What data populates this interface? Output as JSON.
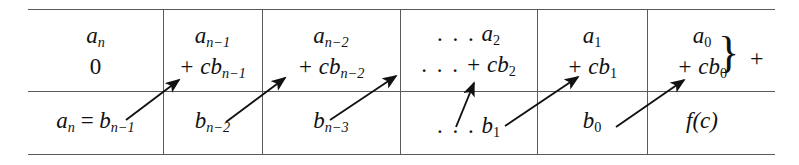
{
  "figure": {
    "type": "synthetic-division-table",
    "title": "",
    "columns": 6,
    "rows": 2,
    "accent_color": "#111111",
    "rule_color": "#5a5a5a",
    "background": "#ffffff",
    "cells": [
      {
        "id": "col1",
        "top_line1": "a",
        "top_sub1": "n",
        "top_line2": "0",
        "top_sub2": "",
        "bottom": "a",
        "bottom_sub": "n",
        "bottom_eq": " = ",
        "bottom_b": "b",
        "bottom_b_sub": "n−1"
      },
      {
        "id": "col2",
        "top_line1": "a",
        "top_sub1": "n−1",
        "top_line2": "+ cb",
        "top_sub2": "n−1",
        "bottom": "b",
        "bottom_sub": "n−2",
        "bottom_eq": "",
        "bottom_b": "",
        "bottom_b_sub": ""
      },
      {
        "id": "col3",
        "top_line1": "a",
        "top_sub1": "n−2",
        "top_line2": "+ cb",
        "top_sub2": "n−2",
        "bottom": "b",
        "bottom_sub": "n−3",
        "bottom_eq": "",
        "bottom_b": "",
        "bottom_b_sub": ""
      },
      {
        "id": "col4",
        "top_line1": "a",
        "top_sub1": "2",
        "top_line2": "+ cb",
        "top_sub2": "2",
        "bottom": "b",
        "bottom_sub": "1",
        "bottom_eq": "",
        "bottom_b": "",
        "bottom_b_sub": "",
        "leading_dots_line1": ". . .",
        "leading_dots_line2": ". . .",
        "leading_dots_bottom": ". . ."
      },
      {
        "id": "col5",
        "top_line1": "a",
        "top_sub1": "1",
        "top_line2": "+ cb",
        "top_sub2": "1",
        "bottom": "b",
        "bottom_sub": "0",
        "bottom_eq": "",
        "bottom_b": "",
        "bottom_b_sub": ""
      },
      {
        "id": "col6",
        "top_line1": "a",
        "top_sub1": "0",
        "top_line2": "+ cb",
        "top_sub2": "0",
        "bottom": "f(c)",
        "bottom_sub": "",
        "bottom_eq": "",
        "bottom_b": "",
        "bottom_b_sub": ""
      }
    ],
    "brace_glyph": "}",
    "trailing_plus": "+",
    "arrow_count": 5,
    "arrow_description": "diagonal arrows from each bottom-row entry to the next column's top-row + cb term"
  }
}
